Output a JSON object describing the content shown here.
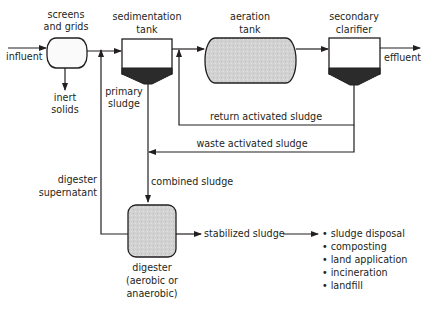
{
  "diagram": {
    "type": "process flow",
    "colors": {
      "stroke": "#231f20",
      "fill_gray": "#cfcfcf",
      "fill_white": "#ffffff",
      "sludge_dark": "#2b2b2b"
    },
    "nodes": {
      "screens": {
        "label_line1": "screens",
        "label_line2": "and grids"
      },
      "sedimentation": {
        "label_line1": "sedimentation",
        "label_line2": "tank"
      },
      "aeration": {
        "label_line1": "aeration",
        "label_line2": "tank"
      },
      "clarifier": {
        "label_line1": "secondary",
        "label_line2": "clarifier"
      },
      "digester": {
        "label_line1": "digester",
        "label_line2": "(aerobic or",
        "label_line3": "anaerobic)"
      }
    },
    "flows": {
      "influent": "influent",
      "effluent": "effluent",
      "inert_line1": "inert",
      "inert_line2": "solids",
      "primary_line1": "primary",
      "primary_line2": "sludge",
      "return": "return activated sludge",
      "waste": "waste activated sludge",
      "combined": "combined sludge",
      "supernatant_line1": "digester",
      "supernatant_line2": "supernatant",
      "stabilized": "stabilized sludge"
    },
    "disposal_options": [
      "• sludge disposal",
      "• composting",
      "• land application",
      "• incineration",
      "• landfill"
    ]
  }
}
